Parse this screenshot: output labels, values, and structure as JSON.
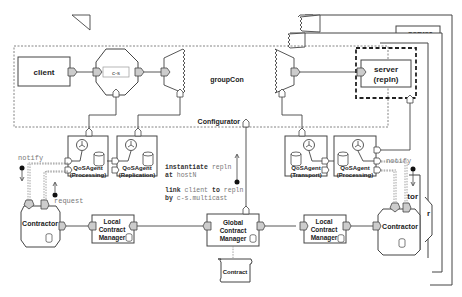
{
  "diagram": {
    "group_label": "groupCon",
    "configurator_label": "Configurator",
    "client_label": "client",
    "connector_label": "c-s",
    "server_label_1": "server",
    "server_label_2": "(repln)",
    "server_back_label": "server",
    "qos_agents": [
      {
        "name": "QoSAgent",
        "role": "(Processing)"
      },
      {
        "name": "QoSAgent",
        "role": "(Replication)"
      },
      {
        "name": "QoSAgent",
        "role": "(Transport)"
      },
      {
        "name": "QoSAgent",
        "role": "(Processing)"
      }
    ],
    "left_notify": "notify",
    "left_request": "request",
    "right_notify": "notify",
    "contractor_label": "Contractor",
    "back_contractor_partial": "tor",
    "back_contractor_partial2": "r",
    "local_manager": [
      "Local",
      "Contract",
      "Manager"
    ],
    "global_manager": [
      "Global",
      "Contract",
      "Manager"
    ],
    "contract_label": "Contract",
    "instructions": {
      "line1_keyword": "instantiate",
      "line1_arg": "repln",
      "line2_keyword": "at",
      "line2_arg": "hostN",
      "line3_keyword": "link",
      "line3_arg1": "client",
      "line3_mid": "to",
      "line3_arg2": "repln",
      "line4_keyword": "by",
      "line4_arg": "c-s.multicast"
    }
  }
}
